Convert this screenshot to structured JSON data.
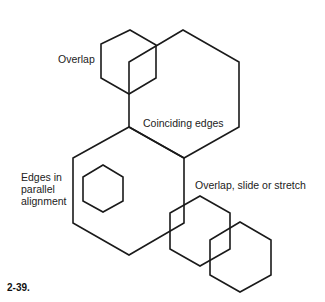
{
  "labels": {
    "overlap": "Overlap",
    "coinciding": "Coinciding edges",
    "parallel_line1": "Edges in",
    "parallel_line2": "parallel",
    "parallel_line3": "alignment",
    "overlap_slide": "Overlap, slide or stretch"
  },
  "figure_number": "2-39.",
  "colors": {
    "stroke": "#1a1a1a",
    "text": "#222222"
  }
}
